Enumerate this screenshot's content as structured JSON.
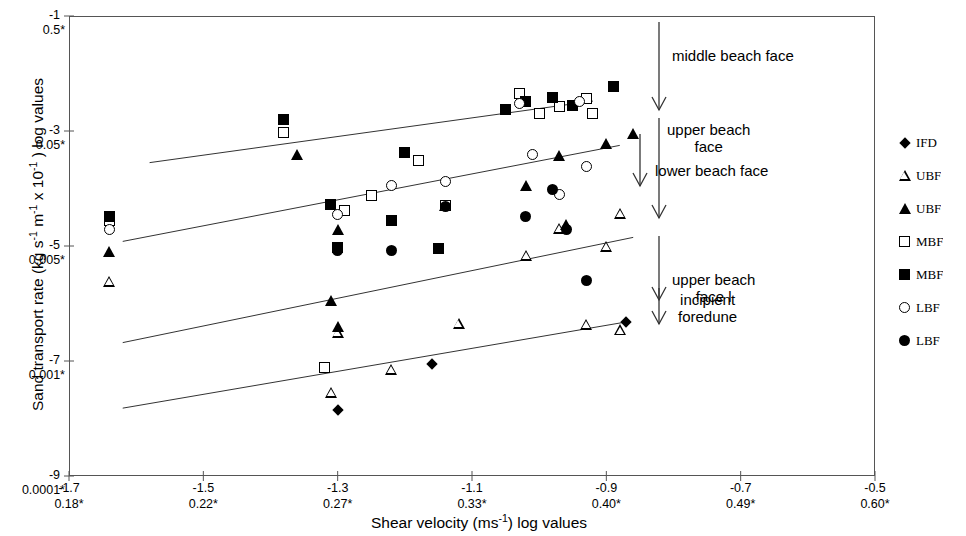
{
  "chart_data": {
    "type": "scatter",
    "title": "",
    "xlabel": "Shear velocity (ms-1) log values",
    "ylabel": "Sand transport rate (kg s-1 m-1 x 10-1 ) log values",
    "xlim": [
      -1.7,
      -0.5
    ],
    "ylim": [
      -9,
      -1
    ],
    "grid": false,
    "legend_position": "right",
    "x_ticks_primary": [
      "-1.7",
      "-1.5",
      "-1.3",
      "-1.1",
      "-0.9",
      "-0.7",
      "-0.5"
    ],
    "x_ticks_secondary": [
      "0.18*",
      "0.22*",
      "0.27*",
      "0.33*",
      "0.40*",
      "0.49*",
      "0.60*"
    ],
    "y_ticks_primary": [
      "-1",
      "-3",
      "-5",
      "-7",
      "-9"
    ],
    "y_ticks_secondary": [
      "0.5*",
      "0.05*",
      "0.005*",
      "0.001*",
      "0.0001*"
    ],
    "series": [
      {
        "name": "IFD",
        "marker": "diamond-filled",
        "points": [
          [
            -1.3,
            -7.85
          ],
          [
            -1.16,
            -7.05
          ],
          [
            -0.87,
            -6.32
          ]
        ]
      },
      {
        "name": "UBF",
        "marker": "triangle-open",
        "points": [
          [
            -1.64,
            -5.62
          ],
          [
            -1.31,
            -7.35
          ],
          [
            -1.3,
            -6.12
          ],
          [
            -1.22,
            -6.58
          ],
          [
            -1.12,
            -5.58
          ],
          [
            -1.02,
            -4.2
          ],
          [
            -0.97,
            -3.55
          ],
          [
            -0.93,
            -5.02
          ],
          [
            -0.88,
            -4.93
          ],
          [
            -0.9,
            -3.28
          ],
          [
            -0.88,
            -2.52
          ]
        ]
      },
      {
        "name": "UBF",
        "marker": "triangle-filled",
        "points": [
          [
            -1.64,
            -5.1
          ],
          [
            -1.36,
            -3.4
          ],
          [
            -1.31,
            -5.95
          ],
          [
            -1.3,
            -6.4
          ],
          [
            -1.3,
            -4.72
          ],
          [
            -1.14,
            -4.3
          ],
          [
            -1.02,
            -3.95
          ],
          [
            -0.97,
            -3.42
          ],
          [
            -0.96,
            -4.62
          ],
          [
            -0.9,
            -3.22
          ],
          [
            -0.86,
            -3.05
          ]
        ]
      },
      {
        "name": "MBF",
        "marker": "square-open",
        "points": [
          [
            -1.64,
            -4.55
          ],
          [
            -1.38,
            -3.02
          ],
          [
            -1.32,
            -7.12
          ],
          [
            -1.29,
            -4.38
          ],
          [
            -1.25,
            -4.12
          ],
          [
            -1.18,
            -3.52
          ],
          [
            -1.14,
            -4.3
          ],
          [
            -1.03,
            -2.35
          ],
          [
            -1.0,
            -2.7
          ],
          [
            -0.97,
            -2.58
          ],
          [
            -0.93,
            -2.43
          ],
          [
            -0.92,
            -2.7
          ]
        ]
      },
      {
        "name": "MBF",
        "marker": "square-filled",
        "points": [
          [
            -1.64,
            -4.48
          ],
          [
            -1.38,
            -2.8
          ],
          [
            -1.31,
            -4.28
          ],
          [
            -1.3,
            -5.02
          ],
          [
            -1.22,
            -4.55
          ],
          [
            -1.2,
            -3.38
          ],
          [
            -1.15,
            -5.05
          ],
          [
            -1.05,
            -2.62
          ],
          [
            -1.02,
            -2.48
          ],
          [
            -0.98,
            -2.42
          ],
          [
            -0.95,
            -2.55
          ],
          [
            -0.89,
            -2.22
          ]
        ]
      },
      {
        "name": "LBF",
        "marker": "circle-open",
        "points": [
          [
            -1.64,
            -4.72
          ],
          [
            -1.3,
            -4.45
          ],
          [
            -1.22,
            -3.95
          ],
          [
            -1.14,
            -3.88
          ],
          [
            -1.03,
            -2.52
          ],
          [
            -1.01,
            -3.4
          ],
          [
            -0.97,
            -4.1
          ],
          [
            -0.94,
            -2.48
          ],
          [
            -0.93,
            -3.62
          ]
        ]
      },
      {
        "name": "LBF",
        "marker": "circle-filled",
        "points": [
          [
            -1.3,
            -5.08
          ],
          [
            -1.22,
            -5.08
          ],
          [
            -1.14,
            -4.32
          ],
          [
            -1.02,
            -4.48
          ],
          [
            -0.98,
            -4.02
          ],
          [
            -0.96,
            -4.72
          ],
          [
            -0.93,
            -5.6
          ]
        ]
      }
    ],
    "trend_lines": [
      {
        "name": "middle-beach-face-fit",
        "x0": -1.58,
        "y0": -3.55,
        "x1": -0.92,
        "y1": -2.48
      },
      {
        "name": "lower-beach-face-fit",
        "x0": -1.62,
        "y0": -4.92,
        "x1": -0.88,
        "y1": -3.25
      },
      {
        "name": "upper-beach-face-fit",
        "x0": -1.62,
        "y0": -6.68,
        "x1": -0.86,
        "y1": -4.85
      },
      {
        "name": "incipient-foredune-fit",
        "x0": -1.62,
        "y0": -7.82,
        "x1": -0.87,
        "y1": -6.32
      }
    ],
    "annotations": [
      {
        "label": "middle beach face",
        "arrow": "down"
      },
      {
        "label": "upper beach\nface",
        "arrow": "down"
      },
      {
        "label": "lower beach face",
        "arrow": "down"
      },
      {
        "label": "upper beach\nface l",
        "arrow": "down"
      },
      {
        "label": "incipient\nforedune",
        "arrow": "down"
      }
    ]
  },
  "axes": {
    "y_title_pre": "Sand transport rate (kg s",
    "y_title_sup1": "-1",
    "y_title_mid1": " m",
    "y_title_sup2": "-1",
    "y_title_mid2": " x 10",
    "y_title_sup3": "-1",
    "y_title_post": " ) log values",
    "x_title_pre": "Shear velocity (ms",
    "x_title_sup": "-1",
    "x_title_post": ") log values"
  },
  "legend": {
    "items": [
      {
        "label": "IFD",
        "marker": "diamond-filled"
      },
      {
        "label": "UBF",
        "marker": "triangle-open"
      },
      {
        "label": "UBF",
        "marker": "triangle-filled"
      },
      {
        "label": "MBF",
        "marker": "square-open"
      },
      {
        "label": "MBF",
        "marker": "square-filled"
      },
      {
        "label": "LBF",
        "marker": "circle-open"
      },
      {
        "label": "LBF",
        "marker": "circle-filled"
      }
    ]
  },
  "colors": {
    "marker": "#000000",
    "axis": "#555555",
    "background": "#ffffff"
  }
}
